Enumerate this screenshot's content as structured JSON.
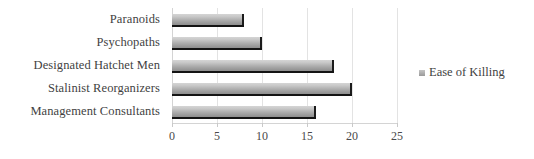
{
  "chart_data": {
    "type": "bar",
    "orientation": "horizontal",
    "title": "",
    "xlabel": "",
    "ylabel": "",
    "categories": [
      "Paranoids",
      "Psychopaths",
      "Designated Hatchet Men",
      "Stalinist Reorganizers",
      "Management Consultants"
    ],
    "series": [
      {
        "name": "Ease of Killing",
        "values": [
          8,
          10,
          18,
          20,
          16
        ]
      }
    ],
    "xlim": [
      0,
      25
    ],
    "xticks": [
      0,
      5,
      10,
      15,
      20,
      25
    ],
    "xtick_labels": [
      "0",
      "5",
      "10",
      "15",
      "20",
      "25"
    ],
    "grid": true,
    "legend_position": "right",
    "legend_entries": [
      "Ease of Killing"
    ],
    "colors": {
      "bar_light": "#d5d5d5",
      "bar_dark": "#8e8e8e",
      "bar_edge": "#1c1c1c",
      "gridline": "#e3e3e3",
      "axis": "#d4d4d4",
      "text": "#3f3f3f",
      "background": "#ffffff"
    }
  }
}
